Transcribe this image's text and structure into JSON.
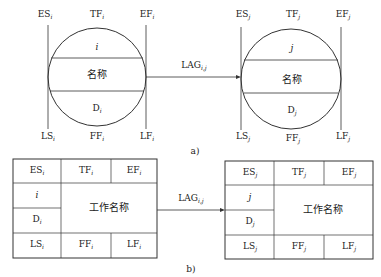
{
  "diagram_a": {
    "caption": "a)",
    "left_node": {
      "top_labels": [
        {
          "main": "ES",
          "sub": "i"
        },
        {
          "main": "TF",
          "sub": "i"
        },
        {
          "main": "EF",
          "sub": "i"
        }
      ],
      "bottom_labels": [
        {
          "main": "LS",
          "sub": "i"
        },
        {
          "main": "FF",
          "sub": "i"
        },
        {
          "main": "LF",
          "sub": "i"
        }
      ],
      "id": "i",
      "name": "名称",
      "duration": {
        "main": "D",
        "sub": "i"
      }
    },
    "right_node": {
      "top_labels": [
        {
          "main": "ES",
          "sub": "j"
        },
        {
          "main": "TF",
          "sub": "j"
        },
        {
          "main": "EF",
          "sub": "j"
        }
      ],
      "bottom_labels": [
        {
          "main": "LS",
          "sub": "j"
        },
        {
          "main": "FF",
          "sub": "j"
        },
        {
          "main": "LF",
          "sub": "j"
        }
      ],
      "id": "j",
      "name": "名称",
      "duration": {
        "main": "D",
        "sub": "j"
      }
    },
    "arrow": {
      "main": "LAG",
      "sub": "i,j"
    }
  },
  "diagram_b": {
    "caption": "b)",
    "left_node": {
      "top_cells": [
        {
          "main": "ES",
          "sub": "i"
        },
        {
          "main": "TF",
          "sub": "i"
        },
        {
          "main": "EF",
          "sub": "i"
        }
      ],
      "bottom_cells": [
        {
          "main": "LS",
          "sub": "i"
        },
        {
          "main": "FF",
          "sub": "i"
        },
        {
          "main": "LF",
          "sub": "i"
        }
      ],
      "id": "i",
      "duration": {
        "main": "D",
        "sub": "i"
      },
      "name": "工作名称"
    },
    "right_node": {
      "top_cells": [
        {
          "main": "ES",
          "sub": "j"
        },
        {
          "main": "TF",
          "sub": "j"
        },
        {
          "main": "EF",
          "sub": "j"
        }
      ],
      "bottom_cells": [
        {
          "main": "LS",
          "sub": "j"
        },
        {
          "main": "FF",
          "sub": "j"
        },
        {
          "main": "LF",
          "sub": "j"
        }
      ],
      "id": "j",
      "duration": {
        "main": "D",
        "sub": "j"
      },
      "name": "工作名称"
    },
    "arrow": {
      "main": "LAG",
      "sub": "i,j"
    }
  }
}
